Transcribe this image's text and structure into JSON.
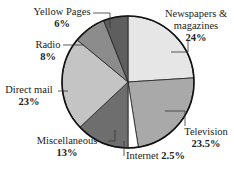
{
  "chart_data": {
    "type": "pie",
    "title": "",
    "start_angle_deg": 0,
    "direction": "clockwise",
    "slices": [
      {
        "label": "Newspapers & magazines",
        "value": 24,
        "value_label": "24%",
        "color": "#e6e6e6"
      },
      {
        "label": "Television",
        "value": 23.5,
        "value_label": "23.5%",
        "color": "#a9a9a9"
      },
      {
        "label": "Internet",
        "value": 2.5,
        "value_label": "2.5%",
        "color": "#ffffff"
      },
      {
        "label": "Miscellaneous",
        "value": 13,
        "value_label": "13%",
        "color": "#6e6e6e"
      },
      {
        "label": "Direct mail",
        "value": 23,
        "value_label": "23%",
        "color": "#c4c4c4"
      },
      {
        "label": "Radio",
        "value": 8,
        "value_label": "8%",
        "color": "#8c8c8c"
      },
      {
        "label": "Yellow Pages",
        "value": 6,
        "value_label": "6%",
        "color": "#5e5e5e"
      }
    ]
  },
  "labels": {
    "newspapers_l1": "Newspapers &",
    "newspapers_l2": "magazines",
    "newspapers_pct": "24%",
    "television": "Television",
    "television_pct": "23.5%",
    "internet": "Internet",
    "internet_pct": "2.5%",
    "misc": "Miscellaneous",
    "misc_pct": "13%",
    "direct": "Direct mail",
    "direct_pct": "23%",
    "radio": "Radio",
    "radio_pct": "8%",
    "yellow": "Yellow Pages",
    "yellow_pct": "6%"
  }
}
